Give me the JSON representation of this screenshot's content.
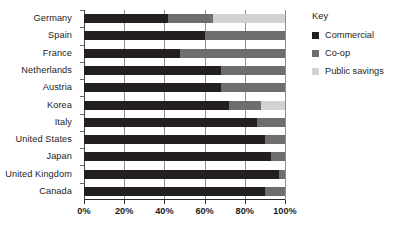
{
  "chart_data": {
    "type": "bar",
    "orientation": "horizontal",
    "stacked": true,
    "title": "",
    "xlabel": "",
    "ylabel": "",
    "xlim": [
      0,
      100
    ],
    "grid": true,
    "legend_position": "right",
    "categories": [
      "Germany",
      "Spain",
      "France",
      "Netherlands",
      "Austria",
      "Korea",
      "Italy",
      "United States",
      "Japan",
      "United Kingdom",
      "Canada"
    ],
    "xticks": [
      0,
      20,
      40,
      60,
      80,
      100
    ],
    "xtick_labels": [
      "0%",
      "20%",
      "40%",
      "60%",
      "80%",
      "100%"
    ],
    "series": [
      {
        "name": "Commercial",
        "color": "#231f20",
        "values": [
          42,
          60,
          48,
          68,
          68,
          72,
          86,
          90,
          93,
          97,
          90
        ]
      },
      {
        "name": "Co-op",
        "color": "#6e6e6e",
        "values": [
          22,
          40,
          52,
          32,
          32,
          16,
          14,
          10,
          7,
          3,
          10
        ]
      },
      {
        "name": "Public savings",
        "color": "#d2d2d2",
        "values": [
          36,
          0,
          0,
          0,
          0,
          12,
          0,
          0,
          0,
          0,
          0
        ]
      }
    ]
  },
  "legend": {
    "title": "Key",
    "items": [
      {
        "label": "Commercial",
        "color": "#231f20"
      },
      {
        "label": "Co-op",
        "color": "#6e6e6e"
      },
      {
        "label": "Public savings",
        "color": "#d2d2d2"
      }
    ]
  },
  "colors": {
    "background": "#ffffff",
    "text": "#1c1c1c",
    "gridline": "#8f8f8f",
    "axis": "#2b2b2b"
  }
}
